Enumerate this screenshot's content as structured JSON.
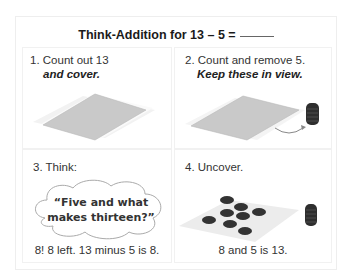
{
  "title": {
    "text": "Think-Addition for 13 – 5 ="
  },
  "panels": [
    {
      "step": "1. Count out 13",
      "emphasis": "and cover."
    },
    {
      "step": "2. Count and remove 5.",
      "emphasis": "Keep these in view."
    },
    {
      "step": "3. Think:",
      "thought_line1": "“Five and what",
      "thought_line2": "makes thirteen?”",
      "caption": "8! 8 left. 13 minus 5 is 8."
    },
    {
      "step": "4. Uncover.",
      "caption": "8 and 5 is 13."
    }
  ],
  "colors": {
    "mat": "#c6c6c6",
    "counter": "#333333",
    "shadow": "#ececec"
  }
}
